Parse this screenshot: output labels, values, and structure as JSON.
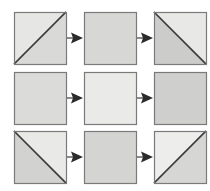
{
  "figure": {
    "type": "process-grid-diagram",
    "width": 210,
    "height": 191,
    "background": "#ffffff",
    "rows": 3,
    "columns": 3
  },
  "palette": {
    "square_border": "#7a7a7a",
    "diagonal_line": "#3a3a3a",
    "arrow_color": "#2b2b2b",
    "fill_light": "#ececeb",
    "fill_medium": "#dcdcdb",
    "fill_dark": "#cfcfce",
    "background": "#ffffff"
  },
  "geometry": {
    "cell_size": 52,
    "col_x": [
      14,
      84,
      154
    ],
    "row_y": [
      12,
      72,
      131
    ],
    "arrow_shaft_width": 18,
    "arrow_head_width": 12,
    "arrow_head_height": 11
  },
  "cells": [
    {
      "id": "r1c1",
      "row": 1,
      "col": 1,
      "name": "square-row1-col1",
      "diagonal": "bottom-left-to-top-right",
      "upper_fill": "#e6e6e5",
      "lower_fill": "#d9d9d8",
      "label": "Square with rising diagonal"
    },
    {
      "id": "r1c2",
      "row": 1,
      "col": 2,
      "name": "square-row1-col2",
      "diagonal": "none",
      "upper_fill": "#d7d7d6",
      "lower_fill": "#d7d7d6",
      "label": "Plain medium-gray square"
    },
    {
      "id": "r1c3",
      "row": 1,
      "col": 3,
      "name": "square-row1-col3",
      "diagonal": "top-left-to-bottom-right",
      "upper_fill": "#cccccb",
      "lower_fill": "#e8e8e7",
      "label": "Square with falling diagonal"
    },
    {
      "id": "r2c1",
      "row": 2,
      "col": 1,
      "name": "square-row2-col1",
      "diagonal": "none",
      "upper_fill": "#dbdbda",
      "lower_fill": "#dbdbda",
      "label": "Plain gray square"
    },
    {
      "id": "r2c2",
      "row": 2,
      "col": 2,
      "name": "square-row2-col2",
      "diagonal": "none",
      "upper_fill": "#eaeae9",
      "lower_fill": "#eaeae9",
      "label": "Plain light-gray square"
    },
    {
      "id": "r2c3",
      "row": 2,
      "col": 3,
      "name": "square-row2-col3",
      "diagonal": "none",
      "upper_fill": "#cfcfce",
      "lower_fill": "#cfcfce",
      "label": "Plain medium-gray square"
    },
    {
      "id": "r3c1",
      "row": 3,
      "col": 1,
      "name": "square-row3-col1",
      "diagonal": "top-left-to-bottom-right",
      "upper_fill": "#d2d2d1",
      "lower_fill": "#e9e9e8",
      "label": "Square with falling diagonal"
    },
    {
      "id": "r3c2",
      "row": 3,
      "col": 2,
      "name": "square-row3-col2",
      "diagonal": "none",
      "upper_fill": "#d4d4d3",
      "lower_fill": "#d4d4d3",
      "label": "Plain medium-gray square"
    },
    {
      "id": "r3c3",
      "row": 3,
      "col": 3,
      "name": "square-row3-col3",
      "diagonal": "bottom-left-to-top-right",
      "upper_fill": "#ededec",
      "lower_fill": "#d6d6d5",
      "label": "Square with rising diagonal"
    }
  ],
  "arrows": [
    {
      "id": "a-r1-1",
      "name": "arrow-row1-col1-to-col2",
      "row": 1,
      "from": "r1c1",
      "to": "r1c2",
      "direction": "right"
    },
    {
      "id": "a-r1-2",
      "name": "arrow-row1-col2-to-col3",
      "row": 1,
      "from": "r1c2",
      "to": "r1c3",
      "direction": "right"
    },
    {
      "id": "a-r2-1",
      "name": "arrow-row2-col1-to-col2",
      "row": 2,
      "from": "r2c1",
      "to": "r2c2",
      "direction": "right"
    },
    {
      "id": "a-r2-2",
      "name": "arrow-row2-col2-to-col3",
      "row": 2,
      "from": "r2c2",
      "to": "r2c3",
      "direction": "right"
    },
    {
      "id": "a-r3-1",
      "name": "arrow-row3-col1-to-col2",
      "row": 3,
      "from": "r3c1",
      "to": "r3c2",
      "direction": "right"
    },
    {
      "id": "a-r3-2",
      "name": "arrow-row3-col2-to-col3",
      "row": 3,
      "from": "r3c2",
      "to": "r3c3",
      "direction": "right"
    }
  ]
}
